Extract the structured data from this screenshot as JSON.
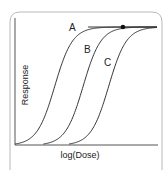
{
  "chart_data": {
    "type": "line",
    "title": "",
    "xlabel": "log(Dose)",
    "ylabel": "Response",
    "grid": false,
    "legend": "none",
    "xlim": [
      0,
      10
    ],
    "ylim": [
      0,
      1
    ],
    "series": [
      {
        "name": "A",
        "ec50": 2.8,
        "slope": 1.6,
        "max": 1.0
      },
      {
        "name": "B",
        "ec50": 4.8,
        "slope": 1.6,
        "max": 1.0
      },
      {
        "name": "C",
        "ec50": 6.6,
        "slope": 1.6,
        "max": 1.0
      }
    ],
    "annotations": [
      {
        "type": "point",
        "label": "",
        "x": 7.6,
        "y": 1.0
      }
    ]
  },
  "caption": "…"
}
